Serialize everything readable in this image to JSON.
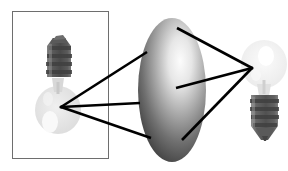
{
  "figure": {
    "width": 288,
    "height": 171,
    "background": "#ffffff"
  },
  "panel": {
    "name": "source-panel",
    "x": 12,
    "y": 11,
    "width": 96,
    "height": 147,
    "border_color": "#6e6e6e",
    "border_width": 1,
    "fill": "#ffffff"
  },
  "objects": [
    {
      "id": "left-bulb",
      "label": "inverted light bulb",
      "orientation": "base-up",
      "glass": {
        "cx": 58,
        "cy": 110,
        "rx": 23,
        "ry": 24,
        "color": "#e2e2e2",
        "highlight_color": "#f7f7f7"
      },
      "base": {
        "x": 45,
        "y": 37,
        "width": 28,
        "height": 42,
        "color": "#6a6a6a",
        "dark_color": "#4a4a4a",
        "thread_count": 4
      }
    },
    {
      "id": "right-bulb",
      "label": "upright light bulb",
      "orientation": "base-down",
      "glass": {
        "cx": 264,
        "cy": 64,
        "rx": 23,
        "ry": 24,
        "color": "#f0f0f0",
        "highlight_color": "#fdfdfd"
      },
      "base": {
        "x": 251,
        "y": 94,
        "width": 27,
        "height": 46,
        "color": "#6a6a6a",
        "dark_color": "#4a4a4a",
        "thread_count": 4
      }
    },
    {
      "id": "center-ellipsoid",
      "label": "shaded lens ellipsoid",
      "cx": 172,
      "cy": 90,
      "rx": 34,
      "ry": 72,
      "light_color": "#fbfbfb",
      "mid_color": "#9a9a9a",
      "dark_color": "#3c3c3c",
      "highlight_x": 64,
      "highlight_y": 34
    }
  ],
  "rays": {
    "color": "#000000",
    "width": 2.6,
    "left_node": {
      "x": 61,
      "y": 107
    },
    "right_node": {
      "x": 252,
      "y": 68
    },
    "left_fan": [
      {
        "id": "ray-left-upper",
        "x2": 147,
        "y2": 52
      },
      {
        "id": "ray-left-middle",
        "x2": 140,
        "y2": 103
      },
      {
        "id": "ray-left-lower",
        "x2": 151,
        "y2": 138
      }
    ],
    "right_fan": [
      {
        "id": "ray-right-upper",
        "x2": 177,
        "y2": 28
      },
      {
        "id": "ray-right-middle",
        "x2": 176,
        "y2": 88
      },
      {
        "id": "ray-right-lower",
        "x2": 182,
        "y2": 140
      }
    ]
  }
}
